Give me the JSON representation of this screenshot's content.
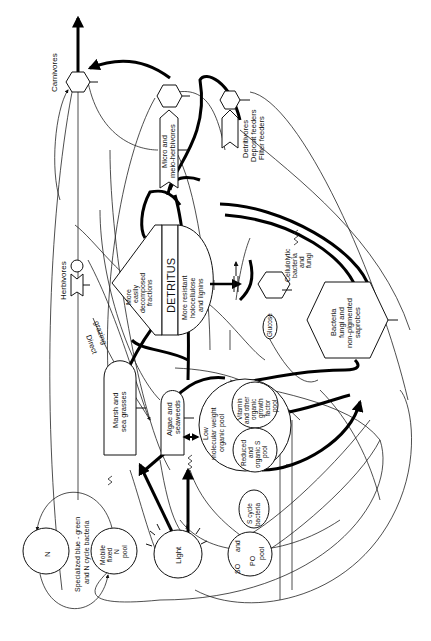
{
  "diagram": {
    "orientation": "rotated 90 degrees counter-clockwise",
    "nodes": {
      "carnivores": "Carnivores",
      "herbivores": "Herbivores",
      "micro_meio_1": "Micro and",
      "micro_meio_2": "meio-herbivores",
      "detritivores_1": "Detritivores",
      "detritivores_2": "Deposit feeders",
      "detritivores_3": "Filter feeders",
      "detritus_title": "DETRITUS",
      "easy_1": "More",
      "easy_2": "easily",
      "easy_3": "decomposed",
      "easy_4": "fractions",
      "resistant_1": "More resistant",
      "resistant_2": "holocellulose",
      "resistant_3": "and lignins",
      "cellulolytic_1": "Cellulolytic",
      "cellulolytic_2": "bacteria",
      "cellulolytic_3": "and",
      "cellulolytic_4": "fungi",
      "glucose": "Glucose",
      "bacteria_1": "Bacteria",
      "bacteria_2": "fungi and",
      "bacteria_3": "non-pigmented",
      "bacteria_4": "saprobes",
      "direct_grazing_1": "Direct",
      "direct_grazing_2": "grazing",
      "marsh_1": "Marsh and",
      "marsh_2": "sea grasses",
      "algae_1": "Algae and",
      "algae_2": "seaweeds",
      "lmw_1": "Low",
      "lmw_2": "molecular weight",
      "lmw_3": "organic pool",
      "vitamin_1": "Vitamin",
      "vitamin_2": "and other",
      "vitamin_3": "organic",
      "vitamin_4": "growth",
      "vitamin_5": "factor",
      "vitamin_6": "pool",
      "reduced_1": "Reduced",
      "reduced_2": "and",
      "reduced_3": "organic S",
      "reduced_4": "pool",
      "scycle_1": "S cycle",
      "scycle_2": "bacteria",
      "so4_1": "SO",
      "so4_2": "and",
      "so4_3": "PO",
      "so4_4": "pool",
      "light": "Light",
      "mobile_1": "Mobile",
      "mobile_2": "fixed",
      "mobile_3": "N",
      "mobile_4": "pool",
      "n2": "N",
      "specialized_1": "Specialized blue - green",
      "specialized_2": "and N cycle bacteria"
    },
    "colors": {
      "ink": "#111111",
      "background": "#ffffff"
    }
  }
}
